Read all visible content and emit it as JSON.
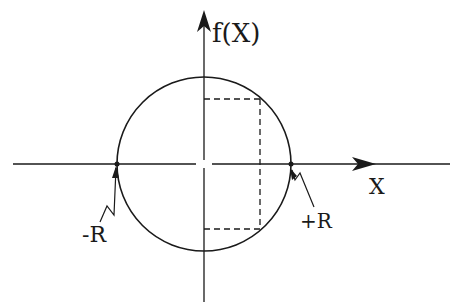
{
  "diagram": {
    "y_axis_label": "f(X)",
    "x_axis_label": "X",
    "left_point_label": "-R",
    "right_point_label": "+R",
    "shapes": {
      "circle": {
        "cx": 204,
        "cy": 164,
        "r": 87
      },
      "inscribed_rectangle": {
        "x_left": 204,
        "x_right": 260,
        "y_top": 99,
        "y_bottom": 229,
        "style": "dashed"
      }
    },
    "colors": {
      "stroke": "#1a1a1a",
      "background": "#ffffff"
    }
  }
}
